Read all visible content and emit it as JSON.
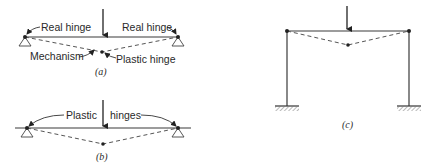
{
  "figure_a": {
    "caption": "(a)",
    "labels": {
      "real_hinge_left": "Real hinge",
      "real_hinge_right": "Real hinge",
      "mechanism": "Mechanism",
      "plastic_hinge": "Plastic hinge"
    }
  },
  "figure_b": {
    "caption": "(b)",
    "labels": {
      "plastic": "Plastic",
      "hinges": "hinges"
    }
  },
  "figure_c": {
    "caption": "(c)"
  },
  "icons": {
    "load_arrow": "down-arrow",
    "pin_support": "triangle-support",
    "fixed_support": "hatched-ground"
  }
}
